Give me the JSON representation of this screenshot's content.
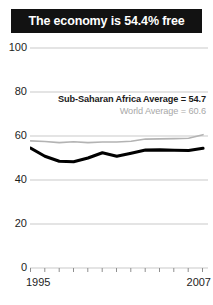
{
  "title": "The economy is 54.4% free",
  "annotations": {
    "region_average": "Sub-Saharan Africa Average = 54.7",
    "world_average": "World Average = 60.6"
  },
  "axis": {
    "y_ticks": [
      "100",
      "80",
      "60",
      "40",
      "20",
      "0"
    ],
    "x_start_label": "1995",
    "x_end_label": "2007"
  },
  "colors": {
    "banner_background": "#121212",
    "banner_text": "#ffffff",
    "region_line": "#000000",
    "world_line": "#b3b3b3",
    "gridline": "#c9c9c9",
    "tick_text": "#1d1d1d",
    "world_label_text": "#a8a8a8"
  },
  "chart_data": {
    "type": "line",
    "title": "The economy is 54.4% free",
    "xlabel": "",
    "ylabel": "",
    "xlim": [
      1995,
      2007
    ],
    "ylim": [
      0,
      100
    ],
    "yticks": [
      0,
      20,
      40,
      60,
      80,
      100
    ],
    "xticks": [
      1995,
      1996,
      1997,
      1998,
      1999,
      2000,
      2001,
      2002,
      2003,
      2004,
      2005,
      2006,
      2007
    ],
    "grid": "horizontal",
    "legend": "inline-annotation",
    "x": [
      1995,
      1996,
      1997,
      1998,
      1999,
      2000,
      2001,
      2002,
      2003,
      2004,
      2005,
      2006,
      2007
    ],
    "series": [
      {
        "name": "Sub-Saharan Africa Average",
        "color": "#000000",
        "width": "thick",
        "label_value": 54.7,
        "values": [
          54.5,
          50.8,
          48.5,
          48.3,
          50.0,
          52.4,
          50.8,
          52.2,
          53.6,
          53.7,
          53.5,
          53.4,
          54.4
        ]
      },
      {
        "name": "World Average",
        "color": "#b3b3b3",
        "width": "thin",
        "label_value": 60.6,
        "values": [
          57.8,
          57.5,
          57.0,
          57.4,
          57.0,
          57.3,
          57.3,
          57.6,
          58.6,
          58.7,
          58.8,
          59.0,
          60.6
        ]
      }
    ]
  }
}
